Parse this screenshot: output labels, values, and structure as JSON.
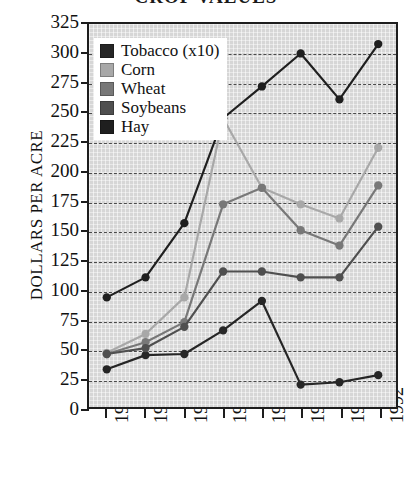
{
  "title": "CROP VALUES",
  "chart_data": {
    "type": "line",
    "title": "CROP VALUES",
    "xlabel": "",
    "ylabel": "DOLLARS PER ACRE",
    "categories": [
      "1959",
      "1964",
      "1969",
      "1974",
      "1978",
      "1982",
      "1987",
      "1992"
    ],
    "ylim": [
      0,
      325
    ],
    "ytick_step": 25,
    "yticks": [
      325,
      300,
      275,
      250,
      225,
      200,
      175,
      150,
      125,
      100,
      75,
      50,
      25,
      0
    ],
    "grid": true,
    "grid_style": "dashed-horizontal",
    "legend_position": "upper-left",
    "series": [
      {
        "name": "Tobacco (x10)",
        "color": "#262626",
        "values": [
          32,
          44,
          45,
          65,
          90,
          19,
          21,
          27
        ]
      },
      {
        "name": "Corn",
        "color": "#a8a8a8",
        "values": [
          46,
          62,
          93,
          245,
          186,
          172,
          160,
          220
        ]
      },
      {
        "name": "Wheat",
        "color": "#787878",
        "values": [
          45,
          55,
          72,
          172,
          186,
          150,
          137,
          188
        ]
      },
      {
        "name": "Soybeans",
        "color": "#4f4f4f",
        "values": [
          45,
          50,
          68,
          115,
          115,
          110,
          110,
          153
        ]
      },
      {
        "name": "Hay",
        "color": "#1f1f1f",
        "values": [
          93,
          110,
          156,
          245,
          272,
          300,
          261,
          308
        ]
      }
    ]
  },
  "legend": {
    "items": [
      {
        "label": "Tobacco (x10)",
        "color": "#262626"
      },
      {
        "label": "Corn",
        "color": "#a8a8a8"
      },
      {
        "label": "Wheat",
        "color": "#787878"
      },
      {
        "label": "Soybeans",
        "color": "#4f4f4f"
      },
      {
        "label": "Hay",
        "color": "#1f1f1f"
      }
    ]
  }
}
